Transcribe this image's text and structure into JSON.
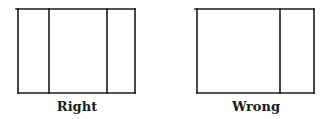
{
  "diagrams": [
    {
      "label": "Right",
      "box": {
        "x1": 18,
        "y1": 9,
        "x2": 135,
        "y2": 93
      },
      "top_line_start_x": 16,
      "dividers_x": [
        49,
        107
      ],
      "label_center_x": 77
    },
    {
      "label": "Wrong",
      "box": {
        "x1": 197,
        "y1": 9,
        "x2": 314,
        "y2": 93
      },
      "top_line_start_x": 195,
      "dividers_x": [
        280
      ],
      "label_center_x": 256
    }
  ],
  "colors": {
    "stroke": "#1a1a1a",
    "background": "#ffffff"
  }
}
